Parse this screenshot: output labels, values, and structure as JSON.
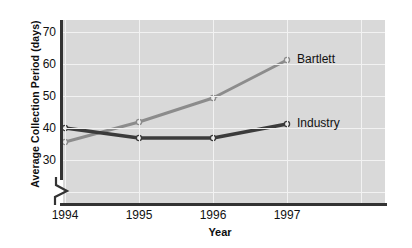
{
  "chart_data": {
    "type": "line",
    "title": "",
    "xlabel": "Year",
    "ylabel": "Average Collection Period (days)",
    "categories": [
      "1994",
      "1995",
      "1996",
      "1997"
    ],
    "x": [
      1994,
      1995,
      1996,
      1997
    ],
    "xlim": [
      1993.7,
      1997.55
    ],
    "ylim": [
      25,
      73
    ],
    "yticks": [
      30,
      40,
      50,
      60,
      70
    ],
    "ytick_labels": [
      "30",
      "40",
      "50",
      "60",
      "70"
    ],
    "y_axis_break": true,
    "grid": "white gridlines on gray plot area, horizontal and vertical",
    "legend_position": "inline labels at right end of each line",
    "plot_background": "#d9d9d9",
    "gridline_color": "#f2f2f2",
    "series": [
      {
        "name": "Bartlett",
        "label": "Bartlett",
        "color": "#8c8c8c",
        "marker": "open-circle",
        "values": [
          42.5,
          47.5,
          53.5,
          63
        ]
      },
      {
        "name": "Industry",
        "label": "Industry",
        "color": "#3b3b3b",
        "marker": "open-circle",
        "values": [
          46,
          43.5,
          43.5,
          47
        ]
      }
    ]
  },
  "axes": {
    "y_title": "Average Collection Period (days)",
    "x_title": "Year"
  }
}
